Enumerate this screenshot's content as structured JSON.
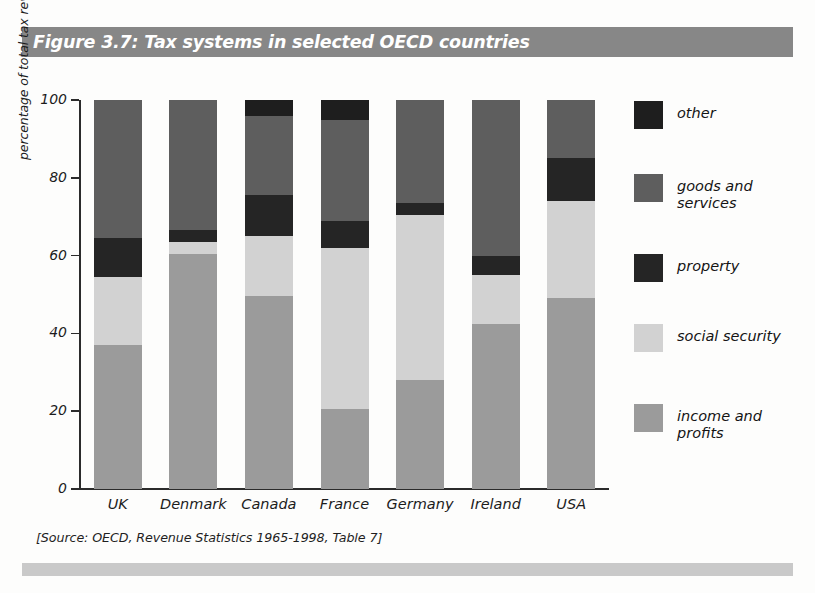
{
  "figure": {
    "title": "Figure 3.7: Tax systems in selected OECD countries",
    "source_note": "[Source: OECD, Revenue Statistics 1965-1998, Table 7]"
  },
  "colors": {
    "title_banner": "#878787",
    "bottom_bar": "#c9c9c9",
    "other": "#1e1e1e",
    "goods_and_services": "#5e5e5e",
    "property": "#252525",
    "social_security": "#d2d2d2",
    "income_and_profits": "#9b9b9b",
    "axis": "#2b2b2b",
    "text": "#1c1c1c"
  },
  "axes": {
    "ylabel": "percentage of total tax revenue",
    "yticks": [
      0,
      20,
      40,
      60,
      80,
      100
    ],
    "ytick_labels": [
      "0",
      "20",
      "40",
      "60",
      "80",
      "100"
    ],
    "ylim": [
      0,
      100
    ],
    "xlabel": ""
  },
  "legend": {
    "position": "right",
    "items": [
      {
        "label": "other",
        "color": "#1e1e1e",
        "key": "other"
      },
      {
        "label": "goods and\nservices",
        "color": "#5e5e5e",
        "key": "goods_and_services"
      },
      {
        "label": "property",
        "color": "#252525",
        "key": "property"
      },
      {
        "label": "social security",
        "color": "#d2d2d2",
        "key": "social_security"
      },
      {
        "label": "income and\nprofits",
        "color": "#9b9b9b",
        "key": "income_and_profits"
      }
    ]
  },
  "chart_data": {
    "type": "bar",
    "subtype": "stacked-bar",
    "title": "Figure 3.7: Tax systems in selected OECD countries",
    "xlabel": "",
    "ylabel": "percentage of total tax revenue",
    "ylim": [
      0,
      100
    ],
    "yticks": [
      0,
      20,
      40,
      60,
      80,
      100
    ],
    "grid": false,
    "legend_position": "right",
    "categories": [
      "UK",
      "Denmark",
      "Canada",
      "France",
      "Germany",
      "Ireland",
      "USA"
    ],
    "series": [
      {
        "name": "income and profits",
        "color": "#9b9b9b",
        "values": [
          37,
          60.5,
          49.5,
          20.5,
          28,
          42.5,
          49
        ]
      },
      {
        "name": "social security",
        "color": "#d2d2d2",
        "values": [
          17.5,
          3,
          15.5,
          41.5,
          42.5,
          12.5,
          25
        ]
      },
      {
        "name": "property",
        "color": "#252525",
        "values": [
          10,
          3,
          10.5,
          7,
          3,
          5,
          11
        ]
      },
      {
        "name": "goods and services",
        "color": "#5e5e5e",
        "values": [
          35.5,
          33.5,
          20.5,
          26,
          26.5,
          40,
          15
        ]
      },
      {
        "name": "other",
        "color": "#1e1e1e",
        "values": [
          0,
          0,
          4,
          5,
          0,
          0,
          0
        ]
      }
    ]
  }
}
